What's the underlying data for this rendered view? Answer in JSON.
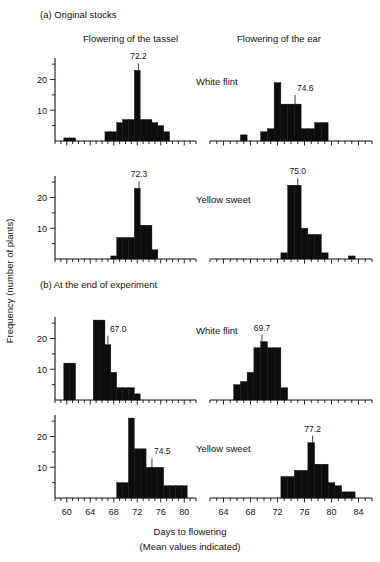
{
  "figure": {
    "y_axis_title": "Frequency (number of plants)",
    "x_axis_title_line1": "Days to flowering",
    "x_axis_title_line2": "(Mean values indicated)"
  },
  "sections": [
    {
      "key": "a",
      "label": "(a) Original stocks"
    },
    {
      "key": "b",
      "label": "(b) At the end of experiment"
    }
  ],
  "columns": [
    {
      "key": "tassel",
      "label": "Flowering of the tassel"
    },
    {
      "key": "ear",
      "label": "Flowering of the ear"
    }
  ],
  "series_labels": {
    "white_flint": "White flint",
    "yellow_sweet": "Yellow sweet"
  },
  "axes": {
    "y_ticks_major": [
      10,
      20
    ],
    "y_ticks_minor": [
      5,
      15,
      25
    ],
    "y_tick_labels": [
      "10",
      "20"
    ],
    "y_max": 27,
    "left_x_ticks_major": [
      60,
      64,
      68,
      72,
      76,
      80
    ],
    "left_x_tick_labels": [
      "60",
      "64",
      "68",
      "72",
      "76",
      "80"
    ],
    "left_x_min": 58,
    "left_x_max": 82,
    "right_x_ticks_major": [
      64,
      68,
      72,
      76,
      80,
      84
    ],
    "right_x_tick_labels": [
      "64",
      "68",
      "72",
      "76",
      "80",
      "84"
    ],
    "right_x_min": 62,
    "right_x_max": 86,
    "x_tick_step": 1
  },
  "chart_data": {
    "type": "bar",
    "xlabel": "Days to flowering (Mean values indicated)",
    "ylabel": "Frequency (number of plants)",
    "ylim": [
      0,
      27
    ],
    "grid": false,
    "legend": "none",
    "bin_width": 1,
    "panels": [
      {
        "id": "a-tassel-white-flint",
        "section": "(a) Original stocks",
        "column": "Flowering of the tassel",
        "series": "White flint",
        "mean": 72.2,
        "mean_label": "72.2",
        "xlim": [
          58,
          82
        ],
        "x": [
          60,
          61,
          67,
          68,
          69,
          70,
          71,
          72,
          73,
          74,
          75,
          76,
          77
        ],
        "values": [
          1,
          1,
          3,
          3,
          6,
          7,
          7,
          23,
          7,
          7,
          6,
          5,
          3
        ]
      },
      {
        "id": "a-ear-white-flint",
        "section": "(a) Original stocks",
        "column": "Flowering of the ear",
        "series": "White flint",
        "mean": 74.6,
        "mean_label": "74.6",
        "xlim": [
          62,
          86
        ],
        "x": [
          67,
          70,
          71,
          72,
          73,
          74,
          75,
          76,
          77,
          78,
          79
        ],
        "values": [
          2,
          3,
          4,
          19,
          12,
          12,
          12,
          4,
          4,
          6,
          6
        ]
      },
      {
        "id": "a-tassel-yellow-sweet",
        "section": "(a) Original stocks",
        "column": "Flowering of the tassel",
        "series": "Yellow sweet",
        "mean": 72.3,
        "mean_label": "72.3",
        "xlim": [
          58,
          82
        ],
        "x": [
          68,
          69,
          70,
          71,
          72,
          73,
          74,
          75
        ],
        "values": [
          1,
          7,
          7,
          7,
          23,
          11,
          11,
          3
        ]
      },
      {
        "id": "a-ear-yellow-sweet",
        "section": "(a) Original stocks",
        "column": "Flowering of the ear",
        "series": "Yellow sweet",
        "mean": 75.0,
        "mean_label": "75.0",
        "xlim": [
          62,
          86
        ],
        "x": [
          73,
          74,
          75,
          76,
          77,
          78,
          79,
          83
        ],
        "values": [
          2,
          24,
          24,
          10,
          8,
          8,
          2,
          1
        ]
      },
      {
        "id": "b-tassel-white-flint",
        "section": "(b) At the end of experiment",
        "column": "Flowering of the tassel",
        "series": "White flint",
        "mean": 67.0,
        "mean_label": "67.0",
        "xlim": [
          58,
          82
        ],
        "x": [
          60,
          61,
          65,
          66,
          67,
          68,
          69,
          70,
          71,
          72
        ],
        "values": [
          12,
          12,
          26,
          26,
          18,
          9,
          4,
          4,
          4,
          2
        ]
      },
      {
        "id": "b-ear-white-flint",
        "section": "(b) At the end of experiment",
        "column": "Flowering of the ear",
        "series": "White flint",
        "mean": 69.7,
        "mean_label": "69.7",
        "xlim": [
          62,
          86
        ],
        "x": [
          66,
          67,
          68,
          69,
          70,
          71,
          72,
          73
        ],
        "values": [
          5,
          6,
          9,
          17,
          19,
          17,
          17,
          4
        ]
      },
      {
        "id": "b-tassel-yellow-sweet",
        "section": "(b) At the end of experiment",
        "column": "Flowering of the tassel",
        "series": "Yellow sweet",
        "mean": 74.5,
        "mean_label": "74.5",
        "xlim": [
          58,
          82
        ],
        "x": [
          69,
          70,
          71,
          72,
          73,
          74,
          75,
          76,
          77,
          78,
          79,
          80
        ],
        "values": [
          5,
          5,
          26,
          16,
          16,
          10,
          10,
          10,
          4,
          4,
          4,
          4
        ]
      },
      {
        "id": "b-ear-yellow-sweet",
        "section": "(b) At the end of experiment",
        "column": "Flowering of the ear",
        "series": "Yellow sweet",
        "mean": 77.2,
        "mean_label": "77.2",
        "xlim": [
          62,
          86
        ],
        "x": [
          73,
          74,
          75,
          76,
          77,
          78,
          79,
          80,
          81,
          82,
          83
        ],
        "values": [
          7,
          7,
          9,
          9,
          18,
          11,
          11,
          5,
          4,
          2,
          2
        ]
      }
    ]
  }
}
